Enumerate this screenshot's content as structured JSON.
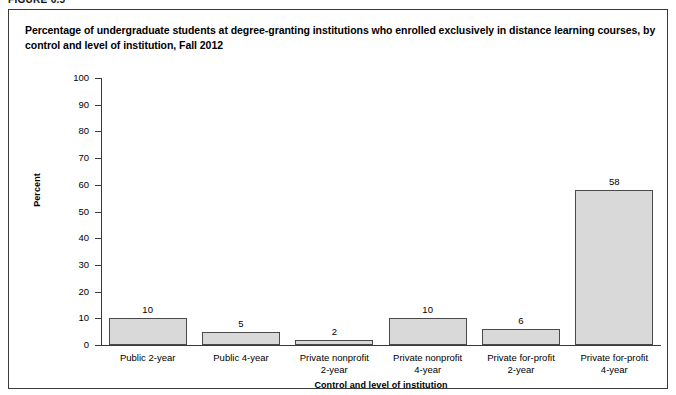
{
  "figure": {
    "number_label": "FIGURE 6.5",
    "title": "Percentage of undergraduate students at degree-granting institutions who enrolled exclusively in distance learning courses, by control and level of institution, Fall 2012"
  },
  "chart_data": {
    "type": "bar",
    "title": "Percentage of undergraduate students at degree-granting institutions who enrolled exclusively in distance learning courses, by control and level of institution, Fall 2012",
    "categories": [
      "Public 2-year",
      "Public 4-year",
      "Private nonprofit 2-year",
      "Private nonprofit 4-year",
      "Private for-profit 2-year",
      "Private for-profit 4-year"
    ],
    "category_lines": [
      [
        "Public 2-year"
      ],
      [
        "Public 4-year"
      ],
      [
        "Private nonprofit",
        "2-year"
      ],
      [
        "Private nonprofit",
        "4-year"
      ],
      [
        "Private for-profit",
        "2-year"
      ],
      [
        "Private for-profit",
        "4-year"
      ]
    ],
    "values": [
      10,
      5,
      2,
      10,
      6,
      58
    ],
    "value_labels": [
      "10",
      "5",
      "2",
      "10",
      "6",
      "58"
    ],
    "xlabel": "Control and level of institution",
    "ylabel": "Percent",
    "ylim": [
      0,
      100
    ],
    "ytick_step": 10,
    "yticks": [
      0,
      10,
      20,
      30,
      40,
      50,
      60,
      70,
      80,
      90,
      100
    ],
    "ytick_labels": [
      "0",
      "10",
      "20",
      "30",
      "40",
      "50",
      "60",
      "70",
      "80",
      "90",
      "100"
    ],
    "grid": false,
    "legend": null,
    "bar_fill_color": "#d9d9d9",
    "bar_border_color": "#4a4a4a",
    "axis_color": "#3a3a3a",
    "background_color": "#ffffff"
  }
}
